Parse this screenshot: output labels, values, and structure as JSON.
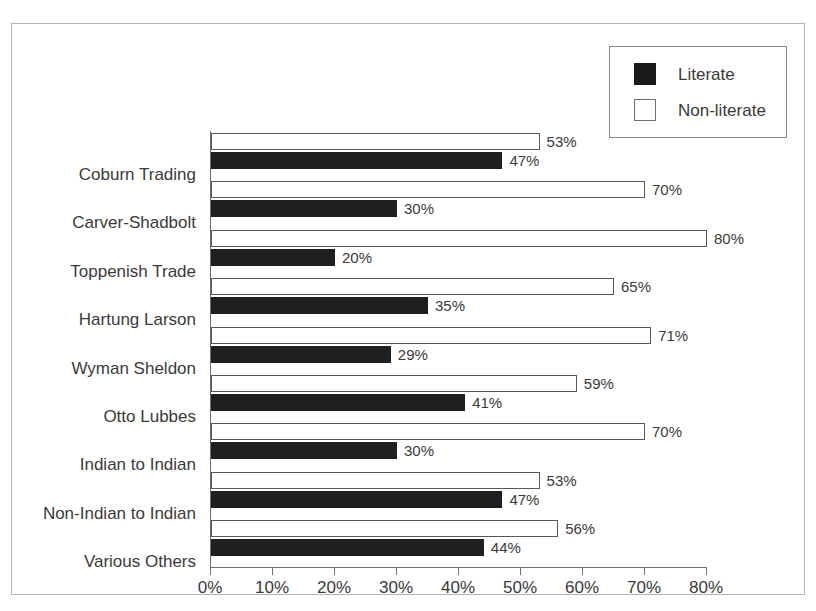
{
  "chart_data": {
    "type": "bar",
    "orientation": "horizontal",
    "title": "",
    "subtitle": "",
    "xlabel": "",
    "ylabel": "",
    "xlim": [
      0,
      80
    ],
    "grid": false,
    "legend_position": "top-right",
    "x_ticks": [
      "0%",
      "10%",
      "20%",
      "30%",
      "40%",
      "50%",
      "60%",
      "70%",
      "80%"
    ],
    "x_tick_values": [
      0,
      10,
      20,
      30,
      40,
      50,
      60,
      70,
      80
    ],
    "categories": [
      "Coburn Trading",
      "Carver-Shadbolt",
      "Toppenish Trade",
      "Hartung Larson",
      "Wyman Sheldon",
      "Otto Lubbes",
      "Indian to Indian",
      "Non-Indian to Indian",
      "Various Others"
    ],
    "series": [
      {
        "name": "Non-literate",
        "color": "#ffffff",
        "edge_color": "#585858",
        "values": [
          53,
          70,
          80,
          65,
          71,
          59,
          70,
          53,
          56
        ],
        "labels": [
          "53%",
          "70%",
          "80%",
          "65%",
          "71%",
          "59%",
          "70%",
          "53%",
          "56%"
        ]
      },
      {
        "name": "Literate",
        "color": "#1f1f1f",
        "edge_color": "#1f1f1f",
        "values": [
          47,
          30,
          20,
          35,
          29,
          41,
          30,
          47,
          44
        ],
        "labels": [
          "47%",
          "30%",
          "20%",
          "35%",
          "29%",
          "41%",
          "30%",
          "47%",
          "44%"
        ]
      }
    ]
  },
  "legend": {
    "entries": [
      {
        "label": "Literate",
        "swatch": "filled-black-square"
      },
      {
        "label": "Non-literate",
        "swatch": "open-white-square"
      }
    ]
  },
  "colors": {
    "literate": "#1f1f1f",
    "non_literate": "#ffffff",
    "frame": "#b4b4b4",
    "axis": "#6e6e6e",
    "text": "#3a3a3a"
  }
}
